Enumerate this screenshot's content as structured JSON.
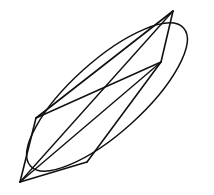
{
  "figure": {
    "kind": "line-drawing",
    "background_color": "#ffffff",
    "stroke_color": "#111111",
    "canvas": {
      "width": 214,
      "height": 195
    },
    "stroke_widths": {
      "outline": 1.5,
      "polygon": 1.6,
      "diagonal": 1.4
    },
    "ellipse": {
      "name": "outer-ellipse",
      "center_x": 107,
      "center_y": 97,
      "semi_major": 103,
      "semi_minor": 36,
      "rotation_deg": -42,
      "extreme_points": {
        "leftmost": [
          11,
          140
        ],
        "rightmost": [
          202,
          45
        ],
        "topmost": [
          173,
          11
        ],
        "bottommost": [
          38,
          185
        ]
      }
    },
    "vertices": [
      {
        "id": "A",
        "label": "top-apex",
        "x": 173,
        "y": 11
      },
      {
        "id": "B",
        "label": "center-right-hub",
        "x": 161,
        "y": 62
      },
      {
        "id": "C",
        "label": "bottom-mid",
        "x": 87,
        "y": 162
      },
      {
        "id": "D",
        "label": "bottom-left-hub",
        "x": 20,
        "y": 182
      },
      {
        "id": "E",
        "label": "mid-left-corner",
        "x": 36,
        "y": 118
      }
    ],
    "edges": [
      {
        "name": "edge-A-E",
        "from": "A",
        "to": "E",
        "role": "polygon"
      },
      {
        "name": "edge-E-D",
        "from": "E",
        "to": "D",
        "role": "polygon"
      },
      {
        "name": "edge-D-C",
        "from": "D",
        "to": "C",
        "role": "polygon"
      },
      {
        "name": "edge-C-B",
        "from": "C",
        "to": "B",
        "role": "polygon"
      },
      {
        "name": "edge-B-A",
        "from": "B",
        "to": "A",
        "role": "polygon"
      },
      {
        "name": "diagonal-B-E",
        "from": "B",
        "to": "E",
        "role": "diagonal"
      },
      {
        "name": "diagonal-B-D",
        "from": "B",
        "to": "D",
        "role": "diagonal"
      },
      {
        "name": "diagonal-A-D",
        "from": "A",
        "to": "D",
        "role": "diagonal"
      }
    ],
    "edge_count": 8,
    "vertex_count": 5
  }
}
